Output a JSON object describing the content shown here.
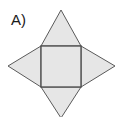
{
  "figure": {
    "label": "A)",
    "colors": {
      "fill": "#e6e6e6",
      "stroke": "#5a5a5a",
      "label": "#1a1a1a",
      "background": "#ffffff"
    },
    "shapes": {
      "square": {
        "x1": 41,
        "y1": 46,
        "x2": 81,
        "y2": 87
      },
      "triangle_top": {
        "apex": [
          61,
          10
        ],
        "base": [
          [
            41,
            46
          ],
          [
            81,
            46
          ]
        ]
      },
      "triangle_left": {
        "apex": [
          8,
          66
        ],
        "base": [
          [
            41,
            46
          ],
          [
            41,
            87
          ]
        ]
      },
      "triangle_right": {
        "apex": [
          115,
          66
        ],
        "base": [
          [
            81,
            46
          ],
          [
            81,
            87
          ]
        ]
      },
      "triangle_bottom": {
        "apex": [
          61,
          118
        ],
        "base": [
          [
            41,
            87
          ],
          [
            81,
            87
          ]
        ]
      }
    }
  }
}
